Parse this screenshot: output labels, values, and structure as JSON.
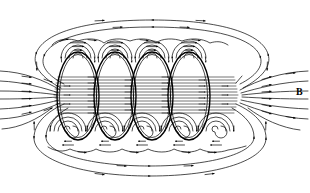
{
  "figure": {
    "kind": "physics-field-line-diagram",
    "width": 310,
    "height": 193,
    "background_color": "#ffffff",
    "line_color": "#000000",
    "labels": [
      {
        "id": "b-field-label",
        "text": "B",
        "x": 296,
        "y": 87,
        "bold": true,
        "meaning": "magnetic flux density vector label on exterior field line"
      }
    ],
    "solenoid": {
      "turns": 4,
      "turn_centers_x": [
        78,
        115,
        152,
        189
      ],
      "turn_center_y": 96,
      "turn_rx": 21,
      "turn_ry": 44,
      "wire_top_y": 52,
      "wire_bottom_y": 140,
      "axis_y": 96
    },
    "interior_lines": {
      "count": 13,
      "x_start": 60,
      "x_end": 232,
      "y_top": 76,
      "y_bottom": 116,
      "direction": "left-to-right"
    },
    "top_wire_loops": {
      "count": 4,
      "centers_x": [
        78,
        115,
        152,
        189
      ],
      "center_y": 56,
      "radii": [
        5,
        9,
        13,
        17
      ],
      "circulation": "clockwise"
    },
    "bottom_wire_loops": {
      "count": 5,
      "centers_x": [
        68,
        105,
        142,
        179,
        216
      ],
      "center_y": 131,
      "radii": [
        5,
        9,
        13,
        17,
        21
      ],
      "circulation": "counter-clockwise",
      "style": "spiral"
    },
    "outer_envelope": {
      "top_ellipse": {
        "cx": 152,
        "cy": 62,
        "rx": 124,
        "ry": 45
      },
      "bottom_ellipse": {
        "cx": 150,
        "cy": 128,
        "rx": 120,
        "ry": 48
      }
    },
    "exterior_return_lines": {
      "left_count": 6,
      "right_count": 6,
      "arrow_direction": "into the solenoid on the left, out of the solenoid on the right"
    }
  }
}
